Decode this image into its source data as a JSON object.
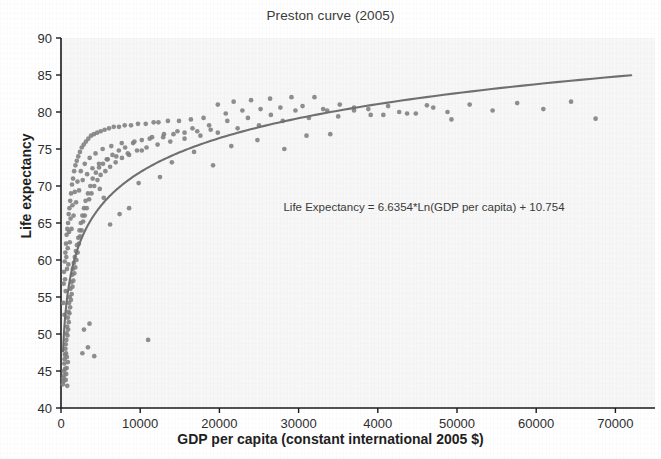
{
  "chart_data": {
    "type": "scatter",
    "title": "Preston curve (2005)",
    "xlabel": "GDP per capita (constant international 2005 $)",
    "ylabel": "Life expectancy",
    "xlim": [
      0,
      75000
    ],
    "ylim": [
      40,
      90
    ],
    "grid": false,
    "legend": null,
    "point_color": "#808080",
    "curve_color": "#707070",
    "annotations": [
      "Life Expectancy = 6.6354*Ln(GDP per capita) + 10.754"
    ],
    "xticks": [
      0,
      10000,
      20000,
      30000,
      40000,
      50000,
      60000,
      70000
    ],
    "xtick_labels": [
      "0",
      "10000",
      "20000",
      "30000",
      "4000",
      "50000",
      "60000",
      "70000"
    ],
    "yticks": [
      40,
      45,
      50,
      55,
      60,
      65,
      70,
      75,
      80,
      85,
      90
    ],
    "ytick_labels": [
      "40",
      "45",
      "50",
      "55",
      "60",
      "65",
      "70",
      "75",
      "80",
      "85",
      "90"
    ],
    "fit": {
      "equation": "Life Expectancy = 6.6354*Ln(GDP per capita) + 10.754",
      "type": "logarithmic",
      "slope": 6.6354,
      "intercept": 10.754,
      "x_start": 260,
      "x_end": 72000
    },
    "points": [
      [
        240,
        43.2
      ],
      [
        300,
        44.0
      ],
      [
        330,
        43.6
      ],
      [
        360,
        45.0
      ],
      [
        390,
        44.4
      ],
      [
        420,
        46.0
      ],
      [
        450,
        46.6
      ],
      [
        480,
        47.2
      ],
      [
        520,
        45.3
      ],
      [
        560,
        48.0
      ],
      [
        600,
        48.6
      ],
      [
        640,
        47.4
      ],
      [
        680,
        49.2
      ],
      [
        700,
        50.1
      ],
      [
        740,
        46.9
      ],
      [
        780,
        51.0
      ],
      [
        820,
        49.8
      ],
      [
        860,
        52.2
      ],
      [
        900,
        50.6
      ],
      [
        940,
        53.0
      ],
      [
        980,
        51.6
      ],
      [
        1020,
        54.2
      ],
      [
        1060,
        52.8
      ],
      [
        1100,
        55.0
      ],
      [
        1150,
        53.6
      ],
      [
        1200,
        56.1
      ],
      [
        1250,
        54.6
      ],
      [
        1300,
        57.0
      ],
      [
        1350,
        55.4
      ],
      [
        1400,
        58.0
      ],
      [
        1450,
        56.4
      ],
      [
        1500,
        58.8
      ],
      [
        1560,
        57.2
      ],
      [
        1620,
        59.6
      ],
      [
        1680,
        58.2
      ],
      [
        1740,
        60.4
      ],
      [
        1800,
        59.0
      ],
      [
        1880,
        61.2
      ],
      [
        1950,
        60.0
      ],
      [
        2020,
        62.0
      ],
      [
        2100,
        61.0
      ],
      [
        2180,
        63.0
      ],
      [
        2260,
        62.2
      ],
      [
        2340,
        64.0
      ],
      [
        2420,
        63.2
      ],
      [
        2500,
        65.0
      ],
      [
        2600,
        64.0
      ],
      [
        2700,
        66.0
      ],
      [
        2800,
        65.2
      ],
      [
        2900,
        67.0
      ],
      [
        3000,
        66.0
      ],
      [
        3100,
        68.0
      ],
      [
        3250,
        67.0
      ],
      [
        3400,
        69.0
      ],
      [
        3550,
        68.2
      ],
      [
        3700,
        70.0
      ],
      [
        3850,
        69.0
      ],
      [
        4000,
        71.0
      ],
      [
        4200,
        70.0
      ],
      [
        4400,
        71.8
      ],
      [
        4600,
        70.8
      ],
      [
        4800,
        72.5
      ],
      [
        5000,
        71.5
      ],
      [
        5300,
        73.0
      ],
      [
        5600,
        72.0
      ],
      [
        5900,
        73.6
      ],
      [
        6200,
        72.6
      ],
      [
        6500,
        74.2
      ],
      [
        6900,
        73.2
      ],
      [
        7300,
        74.8
      ],
      [
        7700,
        73.8
      ],
      [
        8100,
        75.2
      ],
      [
        8600,
        74.2
      ],
      [
        9100,
        75.8
      ],
      [
        9600,
        74.8
      ],
      [
        10200,
        76.2
      ],
      [
        10800,
        75.2
      ],
      [
        11500,
        76.6
      ],
      [
        12200,
        75.6
      ],
      [
        13000,
        77.0
      ],
      [
        13800,
        76.0
      ],
      [
        14700,
        77.4
      ],
      [
        15600,
        76.4
      ],
      [
        16600,
        77.8
      ],
      [
        17600,
        76.8
      ],
      [
        18700,
        78.2
      ],
      [
        19800,
        77.2
      ],
      [
        21000,
        78.8
      ],
      [
        22300,
        77.8
      ],
      [
        23600,
        79.2
      ],
      [
        25000,
        78.2
      ],
      [
        26500,
        79.6
      ],
      [
        28000,
        78.8
      ],
      [
        29600,
        80.2
      ],
      [
        31300,
        79.2
      ],
      [
        33100,
        80.4
      ],
      [
        35000,
        79.4
      ],
      [
        37000,
        80.6
      ],
      [
        39100,
        79.6
      ],
      [
        41300,
        80.8
      ],
      [
        43700,
        79.8
      ],
      [
        46200,
        80.9
      ],
      [
        48800,
        80.0
      ],
      [
        51600,
        81.0
      ],
      [
        54500,
        80.2
      ],
      [
        57600,
        81.2
      ],
      [
        60900,
        80.4
      ],
      [
        64400,
        81.4
      ],
      [
        67500,
        79.1
      ],
      [
        290,
        54.2
      ],
      [
        340,
        56.8
      ],
      [
        380,
        58.4
      ],
      [
        430,
        52.6
      ],
      [
        470,
        59.8
      ],
      [
        510,
        57.4
      ],
      [
        550,
        61.0
      ],
      [
        590,
        55.8
      ],
      [
        630,
        62.2
      ],
      [
        670,
        60.4
      ],
      [
        710,
        63.4
      ],
      [
        760,
        58.8
      ],
      [
        800,
        64.2
      ],
      [
        850,
        61.6
      ],
      [
        890,
        65.0
      ],
      [
        930,
        59.4
      ],
      [
        970,
        66.2
      ],
      [
        1010,
        63.8
      ],
      [
        1060,
        67.0
      ],
      [
        1110,
        62.4
      ],
      [
        1160,
        68.0
      ],
      [
        1210,
        65.6
      ],
      [
        1270,
        69.0
      ],
      [
        1330,
        64.2
      ],
      [
        1390,
        70.2
      ],
      [
        1450,
        67.4
      ],
      [
        1520,
        71.0
      ],
      [
        1590,
        66.0
      ],
      [
        1660,
        72.0
      ],
      [
        1740,
        69.2
      ],
      [
        1820,
        72.8
      ],
      [
        1900,
        67.8
      ],
      [
        1990,
        73.4
      ],
      [
        2080,
        70.6
      ],
      [
        2180,
        74.0
      ],
      [
        2280,
        69.4
      ],
      [
        2390,
        74.6
      ],
      [
        2500,
        72.0
      ],
      [
        2620,
        75.2
      ],
      [
        2740,
        70.8
      ],
      [
        2870,
        75.6
      ],
      [
        3000,
        73.0
      ],
      [
        3150,
        76.0
      ],
      [
        3300,
        71.6
      ],
      [
        3450,
        76.4
      ],
      [
        3620,
        73.8
      ],
      [
        3790,
        76.8
      ],
      [
        3970,
        72.4
      ],
      [
        4160,
        77.0
      ],
      [
        4360,
        74.4
      ],
      [
        4570,
        77.2
      ],
      [
        4790,
        73.0
      ],
      [
        5020,
        77.4
      ],
      [
        5260,
        75.0
      ],
      [
        5510,
        77.6
      ],
      [
        5780,
        73.6
      ],
      [
        6060,
        77.8
      ],
      [
        6350,
        75.4
      ],
      [
        6660,
        78.0
      ],
      [
        6980,
        74.0
      ],
      [
        7320,
        78.0
      ],
      [
        7670,
        75.8
      ],
      [
        8040,
        78.2
      ],
      [
        8430,
        74.4
      ],
      [
        8840,
        78.2
      ],
      [
        9270,
        76.0
      ],
      [
        9720,
        78.4
      ],
      [
        10200,
        74.8
      ],
      [
        10700,
        78.4
      ],
      [
        11200,
        76.4
      ],
      [
        11700,
        78.6
      ],
      [
        11000,
        49.2
      ],
      [
        12300,
        78.6
      ],
      [
        12900,
        76.6
      ],
      [
        13500,
        78.8
      ],
      [
        14200,
        77.0
      ],
      [
        14900,
        78.8
      ],
      [
        15600,
        77.2
      ],
      [
        16400,
        79.0
      ],
      [
        17200,
        77.4
      ],
      [
        18000,
        79.2
      ],
      [
        18900,
        77.6
      ],
      [
        19800,
        81.0
      ],
      [
        20800,
        79.8
      ],
      [
        21800,
        81.4
      ],
      [
        22900,
        80.2
      ],
      [
        24000,
        81.6
      ],
      [
        25200,
        80.4
      ],
      [
        26400,
        81.8
      ],
      [
        27700,
        80.6
      ],
      [
        29100,
        82.0
      ],
      [
        30500,
        80.8
      ],
      [
        32000,
        82.0
      ],
      [
        33600,
        80.2
      ],
      [
        35200,
        81.0
      ],
      [
        37000,
        80.2
      ],
      [
        38800,
        80.4
      ],
      [
        40700,
        79.6
      ],
      [
        42700,
        80.0
      ],
      [
        44800,
        79.8
      ],
      [
        47000,
        80.6
      ],
      [
        49300,
        79.0
      ],
      [
        600,
        43.8
      ],
      [
        660,
        44.6
      ],
      [
        720,
        45.4
      ],
      [
        790,
        43.0
      ],
      [
        870,
        46.2
      ],
      [
        2700,
        47.4
      ],
      [
        3400,
        48.2
      ],
      [
        4200,
        47.0
      ],
      [
        2900,
        50.6
      ],
      [
        3600,
        51.4
      ],
      [
        6200,
        64.8
      ],
      [
        7400,
        66.2
      ],
      [
        5400,
        68.4
      ],
      [
        4900,
        69.6
      ],
      [
        8600,
        67.0
      ],
      [
        9800,
        70.4
      ],
      [
        12500,
        71.2
      ],
      [
        14000,
        73.2
      ],
      [
        16800,
        74.6
      ],
      [
        19200,
        72.8
      ],
      [
        21500,
        75.4
      ],
      [
        24800,
        76.2
      ],
      [
        28200,
        75.0
      ],
      [
        31000,
        76.8
      ],
      [
        34000,
        77.0
      ]
    ]
  },
  "geometry": {
    "plot_left": 61,
    "plot_right": 655,
    "plot_top": 38,
    "plot_bottom": 408
  }
}
